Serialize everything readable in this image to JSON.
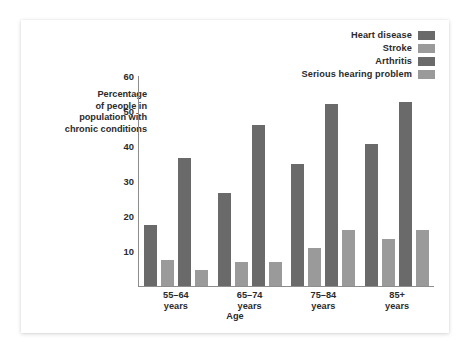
{
  "chart_data": {
    "type": "bar",
    "title": "",
    "xlabel": "Age",
    "ylabel": "Percentage of people in population with chronic conditions",
    "ylabel_lines": [
      "Percentage",
      "of people in",
      "population with",
      "chronic conditions"
    ],
    "categories": [
      "55–64 years",
      "65–74 years",
      "75–84 years",
      "85+ years"
    ],
    "category_lines": [
      [
        "55–64",
        "years"
      ],
      [
        "65–74",
        "years"
      ],
      [
        "75–84",
        "years"
      ],
      [
        "85+",
        "years"
      ]
    ],
    "series": [
      {
        "name": "Heart disease",
        "color": "#6a6a6a",
        "values": [
          17.5,
          26.5,
          35,
          40.5
        ]
      },
      {
        "name": "Stroke",
        "color": "#9a9a9a",
        "values": [
          7.5,
          7,
          11,
          13.5
        ]
      },
      {
        "name": "Arthritis",
        "color": "#6a6a6a",
        "values": [
          36.5,
          46,
          52,
          52.5
        ]
      },
      {
        "name": "Serious hearing problem",
        "color": "#9a9a9a",
        "values": [
          4.5,
          7,
          16,
          16
        ]
      }
    ],
    "ylim": [
      0,
      60
    ],
    "ytick_labels": [
      "10",
      "20",
      "30",
      "40",
      "50",
      "60"
    ],
    "ytick_values": [
      10,
      20,
      30,
      40,
      50,
      60
    ],
    "grid": false,
    "legend_position": "top-right",
    "axis_color": "#8d8d8d",
    "text_color": "#2b2b2b",
    "background": "#ffffff"
  }
}
